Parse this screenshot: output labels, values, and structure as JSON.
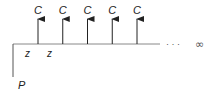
{
  "diagram": {
    "cash_flow_label": "C",
    "cash_flow_count": 5,
    "interval_label": "z",
    "present_value_label": "P",
    "continuation": "· · ·",
    "infinity_symbol": "∞",
    "line_color": "#888888",
    "arrow_color": "#222222"
  }
}
